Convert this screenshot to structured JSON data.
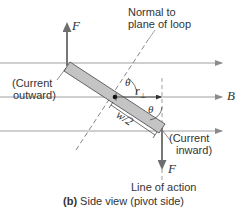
{
  "figure": {
    "caption_prefix": "(b)",
    "caption_text": " Side view (pivot side)"
  },
  "labels": {
    "force_top": "F",
    "force_bottom": "F",
    "field": "B",
    "normal_line1": "Normal to",
    "normal_line2": "plane of loop",
    "current_out_line1": "(Current",
    "current_out_line2": "outward)",
    "current_in_line1": "(Current",
    "current_in_line2": "inward)",
    "theta_top": "θ",
    "theta_right": "θ",
    "r_perp": "r",
    "r_perp_sub": "⊥",
    "half_width": "w/2",
    "line_of_action": "Line of action"
  },
  "colors": {
    "field_line": "#9a9a9a",
    "loop_fill": "#c4c4c4",
    "loop_edge": "#555555",
    "force_arrow": "#777777",
    "dashed": "#666666",
    "text": "#333333"
  }
}
